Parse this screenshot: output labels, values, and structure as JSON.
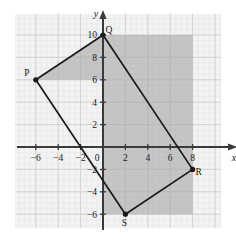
{
  "figure": {
    "type": "coordinate-plane-quadrilateral",
    "background": "#ffffff",
    "grid_paper_color": "#f3f3f3",
    "grid_minor_color": "#e6e6e6",
    "grid_major_color": "#cfcfcf",
    "axis_color": "#3a3a3a",
    "shade_color": "#a8a8a8",
    "shade_opacity": 0.62,
    "outline_color": "#1a1a1a"
  },
  "axes": {
    "x_axis_label": "x",
    "y_axis_label": "y",
    "origin_label": "0",
    "x_ticks": [
      "-6",
      "-4",
      "-2",
      "2",
      "4",
      "6",
      "8"
    ],
    "x_tick_values": [
      -6,
      -4,
      -2,
      2,
      4,
      6,
      8
    ],
    "y_ticks": [
      "10",
      "8",
      "6",
      "4",
      "2",
      "-2",
      "-4",
      "-6"
    ],
    "y_tick_values": [
      10,
      8,
      6,
      4,
      2,
      -2,
      -4,
      -6
    ],
    "xlim": [
      -7.8,
      10.2
    ],
    "ylim": [
      -7.6,
      11.4
    ],
    "unit_px": 11.2,
    "origin_px": [
      103,
      147
    ]
  },
  "chart_data": {
    "type": "scatter",
    "title": "",
    "xlabel": "x",
    "ylabel": "y",
    "xlim": [
      -7.8,
      10.2
    ],
    "ylim": [
      -7.6,
      11.4
    ],
    "grid": true,
    "legend": "none",
    "points": [
      {
        "label": "P",
        "x": -6,
        "y": 6,
        "label_dx": -9,
        "label_dy": -4
      },
      {
        "label": "Q",
        "x": 0,
        "y": 10,
        "label_dx": 6,
        "label_dy": -2
      },
      {
        "label": "R",
        "x": 8,
        "y": -2,
        "label_dx": 6,
        "label_dy": 6
      },
      {
        "label": "S",
        "x": 2,
        "y": -6,
        "label_dx": -1,
        "label_dy": 12
      }
    ],
    "polygon": {
      "name": "PQRS",
      "vertices": [
        [
          -6,
          6
        ],
        [
          0,
          10
        ],
        [
          8,
          -2
        ],
        [
          2,
          -6
        ]
      ],
      "closed": true
    },
    "shaded_regions": [
      {
        "name": "rectangle-shade",
        "vertices": [
          [
            0,
            10
          ],
          [
            8,
            10
          ],
          [
            8,
            -6
          ],
          [
            0,
            -6
          ]
        ]
      },
      {
        "name": "triangle-shade-PQ",
        "vertices": [
          [
            -6,
            6
          ],
          [
            0,
            10
          ],
          [
            0,
            6
          ]
        ]
      }
    ]
  },
  "annotations": {
    "point_labels": [
      "P",
      "Q",
      "R",
      "S"
    ]
  }
}
